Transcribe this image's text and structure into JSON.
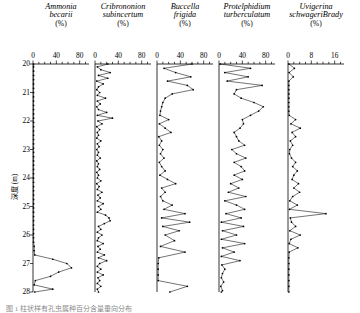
{
  "figure": {
    "axis_title_y": "深度 (m)",
    "caption": "图 1  柱状样有孔虫属种百分含量垂向分布"
  },
  "chart_data": {
    "type": "line",
    "title": "",
    "xlabel": "(%)",
    "ylabel": "深度 (m)",
    "ylim": [
      20,
      28
    ],
    "y_inverted": true,
    "grid": false,
    "legend": "none",
    "yticks": [
      20,
      21,
      22,
      23,
      24,
      25,
      26,
      27,
      28
    ],
    "ytick_labels": [
      "20",
      "21",
      "22",
      "23",
      "24",
      "25",
      "26",
      "27",
      "28"
    ],
    "x_axis_position": "top",
    "marker": "filled-circle",
    "panels": [
      {
        "name": "Ammonia becarii",
        "species_line1": "Ammonia",
        "species_line2": "becarii",
        "units": "(%)",
        "xlim": [
          0,
          96
        ],
        "xticks": [
          0,
          40,
          80
        ],
        "xtick_labels": [
          "0",
          "40",
          "80"
        ],
        "minor_ticks": 4,
        "depths": [
          20.0,
          20.1,
          20.25,
          20.4,
          20.55,
          20.7,
          20.85,
          21.0,
          21.15,
          21.3,
          21.45,
          21.6,
          21.75,
          21.9,
          22.05,
          22.2,
          22.35,
          22.5,
          22.65,
          22.8,
          22.95,
          23.1,
          23.25,
          23.4,
          23.55,
          23.7,
          23.85,
          24.0,
          24.15,
          24.3,
          24.45,
          24.6,
          24.75,
          24.9,
          25.05,
          25.2,
          25.35,
          25.5,
          25.65,
          25.8,
          25.95,
          26.1,
          26.25,
          26.4,
          26.55,
          26.7,
          26.85,
          27.0,
          27.15,
          27.3,
          27.45,
          27.6,
          27.75,
          27.9,
          28.0
        ],
        "values": [
          1,
          1,
          1,
          1,
          1,
          1,
          1,
          1,
          1,
          1,
          1,
          1,
          1,
          1,
          1,
          1,
          1,
          1,
          1,
          1,
          1,
          1,
          1,
          1,
          1,
          1,
          1,
          1,
          1,
          1,
          1,
          1,
          1,
          1,
          1,
          1,
          1,
          1,
          1,
          1,
          1,
          1,
          1,
          2,
          2,
          3,
          34,
          58,
          66,
          44,
          30,
          4,
          2,
          34,
          3
        ]
      },
      {
        "name": "Cribrononion subincertum",
        "species_line1": "Cribrononion",
        "species_line2": "subincertum",
        "units": "(%)",
        "xlim": [
          0,
          96
        ],
        "xticks": [
          0,
          40,
          80
        ],
        "xtick_labels": [
          "0",
          "40",
          "80"
        ],
        "minor_ticks": 4,
        "depths": [
          20.0,
          20.1,
          20.2,
          20.3,
          20.4,
          20.5,
          20.6,
          20.7,
          20.8,
          20.9,
          21.0,
          21.1,
          21.2,
          21.3,
          21.4,
          21.5,
          21.6,
          21.7,
          21.8,
          21.9,
          22.0,
          22.1,
          22.2,
          22.3,
          22.4,
          22.5,
          22.6,
          22.7,
          22.8,
          22.9,
          23.0,
          23.1,
          23.2,
          23.3,
          23.4,
          23.5,
          23.6,
          23.7,
          23.8,
          23.9,
          24.0,
          24.1,
          24.2,
          24.3,
          24.4,
          24.5,
          24.6,
          24.7,
          24.8,
          24.9,
          25.0,
          25.1,
          25.2,
          25.3,
          25.4,
          25.5,
          25.6,
          25.7,
          25.8,
          25.9,
          26.0,
          26.1,
          26.2,
          26.3,
          26.4,
          26.5,
          26.6,
          26.7,
          26.8,
          26.9,
          27.0,
          27.1,
          27.2,
          27.3,
          27.4,
          27.5,
          27.6,
          27.7,
          27.8,
          27.9,
          28.0
        ],
        "values": [
          22,
          4,
          10,
          26,
          6,
          22,
          3,
          14,
          6,
          3,
          8,
          4,
          18,
          4,
          9,
          3,
          6,
          20,
          4,
          30,
          5,
          12,
          3,
          8,
          4,
          6,
          3,
          10,
          4,
          7,
          3,
          6,
          4,
          9,
          3,
          6,
          4,
          8,
          3,
          6,
          4,
          10,
          3,
          7,
          4,
          12,
          5,
          9,
          4,
          14,
          6,
          10,
          4,
          18,
          24,
          26,
          16,
          6,
          10,
          4,
          12,
          6,
          4,
          14,
          5,
          9,
          4,
          16,
          6,
          20,
          8,
          4,
          10,
          4,
          14,
          5,
          8,
          4,
          10,
          4,
          6
        ]
      },
      {
        "name": "Buccella frigida",
        "species_line1": "Buccella",
        "species_line2": "frigida",
        "units": "(%)",
        "xlim": [
          0,
          96
        ],
        "xticks": [
          0,
          40,
          80
        ],
        "xtick_labels": [
          "0",
          "40",
          "80"
        ],
        "minor_ticks": 4,
        "depths": [
          20.0,
          20.15,
          20.3,
          20.45,
          20.6,
          20.75,
          20.9,
          21.05,
          21.2,
          21.35,
          21.5,
          21.65,
          21.8,
          21.95,
          22.1,
          22.25,
          22.4,
          22.55,
          22.7,
          22.85,
          23.0,
          23.15,
          23.3,
          23.45,
          23.6,
          23.75,
          23.9,
          24.05,
          24.2,
          24.35,
          24.5,
          24.65,
          24.8,
          24.95,
          25.1,
          25.25,
          25.4,
          25.55,
          25.7,
          25.85,
          26.0,
          26.2,
          26.4,
          26.6,
          26.8,
          27.0,
          27.2,
          27.4,
          27.6,
          27.8,
          28.0
        ],
        "values": [
          60,
          12,
          32,
          58,
          18,
          52,
          62,
          26,
          14,
          10,
          8,
          6,
          5,
          20,
          4,
          14,
          24,
          3,
          8,
          4,
          10,
          6,
          12,
          4,
          8,
          14,
          5,
          18,
          32,
          8,
          14,
          6,
          10,
          26,
          12,
          48,
          8,
          56,
          10,
          38,
          14,
          30,
          6,
          48,
          3,
          2,
          2,
          2,
          2,
          52,
          22
        ]
      },
      {
        "name": "Protelphidium turberculatum",
        "species_line1": "Protelphidium",
        "species_line2": "turberculatum",
        "units": "(%)",
        "xlim": [
          0,
          96
        ],
        "xticks": [
          0,
          40,
          80
        ],
        "xtick_labels": [
          "0",
          "40",
          "80"
        ],
        "minor_ticks": 4,
        "depths": [
          20.0,
          20.15,
          20.3,
          20.45,
          20.6,
          20.75,
          20.9,
          21.05,
          21.2,
          21.35,
          21.5,
          21.65,
          21.8,
          21.95,
          22.1,
          22.25,
          22.4,
          22.55,
          22.7,
          22.85,
          23.0,
          23.15,
          23.3,
          23.45,
          23.6,
          23.75,
          23.9,
          24.05,
          24.2,
          24.35,
          24.5,
          24.65,
          24.8,
          24.95,
          25.1,
          25.25,
          25.4,
          25.55,
          25.7,
          25.85,
          26.0,
          26.15,
          26.3,
          26.45,
          26.6,
          26.75,
          26.9,
          27.05,
          27.2,
          27.35,
          27.5,
          27.65,
          27.8,
          27.95,
          28.0
        ],
        "values": [
          2,
          54,
          10,
          50,
          14,
          74,
          30,
          26,
          38,
          60,
          76,
          68,
          54,
          40,
          42,
          36,
          26,
          30,
          34,
          44,
          22,
          30,
          46,
          26,
          38,
          44,
          26,
          40,
          20,
          34,
          16,
          46,
          10,
          30,
          44,
          12,
          38,
          4,
          42,
          6,
          30,
          4,
          44,
          6,
          26,
          4,
          36,
          5,
          10,
          6,
          4,
          8,
          3,
          6,
          4
        ]
      },
      {
        "name": "Uvigerina schwageriBrady",
        "species_line1": "Uvigerina",
        "species_line2": "schwageriBrady",
        "units": "(%)",
        "xlim": [
          0,
          19.2
        ],
        "xticks": [
          0,
          8,
          16
        ],
        "xtick_labels": [
          "0",
          "8",
          "16"
        ],
        "minor_ticks": 4,
        "depths": [
          20.0,
          20.15,
          20.3,
          20.45,
          20.6,
          20.75,
          20.9,
          21.05,
          21.2,
          21.35,
          21.5,
          21.65,
          21.8,
          21.95,
          22.1,
          22.25,
          22.4,
          22.55,
          22.7,
          22.85,
          23.0,
          23.15,
          23.3,
          23.45,
          23.6,
          23.75,
          23.9,
          24.05,
          24.2,
          24.35,
          24.5,
          24.65,
          24.8,
          24.95,
          25.1,
          25.25,
          25.4,
          25.55,
          25.7,
          25.85,
          26.0,
          26.15,
          26.3,
          26.45,
          26.6,
          26.8,
          27.0,
          27.2,
          27.4,
          27.6,
          27.8,
          28.0
        ],
        "values": [
          0.3,
          2.2,
          0.4,
          1.8,
          0.3,
          0.3,
          0.3,
          0.3,
          0.3,
          0.3,
          0.3,
          0.3,
          0.4,
          2.6,
          1.0,
          4.2,
          1.4,
          2.6,
          0.8,
          1.6,
          0.6,
          0.5,
          1.2,
          2.6,
          1.6,
          3.2,
          2.0,
          1.4,
          3.6,
          2.0,
          4.0,
          1.6,
          0.6,
          3.2,
          0.5,
          13.0,
          0.8,
          1.2,
          2.6,
          0.6,
          4.2,
          1.0,
          0.4,
          3.4,
          0.4,
          0.3,
          0.3,
          0.3,
          0.3,
          0.3,
          0.3,
          0.3
        ]
      }
    ]
  }
}
